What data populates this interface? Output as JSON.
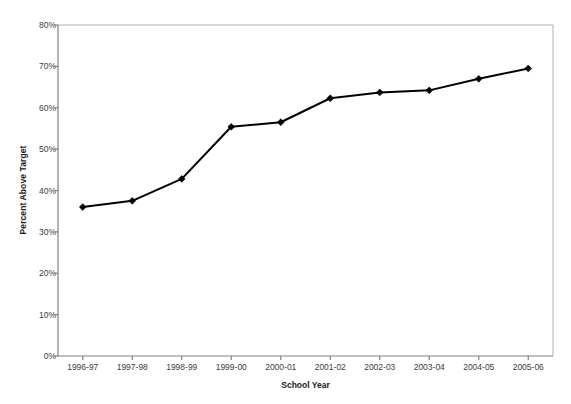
{
  "chart_data": {
    "type": "line",
    "title": "",
    "xlabel": "School Year",
    "ylabel": "Percent Above Target",
    "categories": [
      "1996-97",
      "1997-98",
      "1998-99",
      "1999-00",
      "2000-01",
      "2001-02",
      "2002-03",
      "2003-04",
      "2004-05",
      "2005-06"
    ],
    "values": [
      36.0,
      37.5,
      42.8,
      55.4,
      56.5,
      62.3,
      63.7,
      64.2,
      67.0,
      69.5
    ],
    "series": [
      {
        "name": "Percent Above Target",
        "values": [
          36.0,
          37.5,
          42.8,
          55.4,
          56.5,
          62.3,
          63.7,
          64.2,
          67.0,
          69.5
        ]
      }
    ],
    "ylim": [
      0,
      80
    ],
    "ytick_values": [
      0,
      10,
      20,
      30,
      40,
      50,
      60,
      70,
      80
    ],
    "ytick_labels": [
      "0%",
      "10%",
      "20%",
      "30%",
      "40%",
      "50%",
      "60%",
      "70%",
      "80%"
    ],
    "grid": false,
    "legend": "none",
    "marker": "diamond",
    "line_color": "#000000",
    "marker_color": "#000000",
    "frame_color": "#b0b0b0",
    "axis_color": "#808080"
  }
}
